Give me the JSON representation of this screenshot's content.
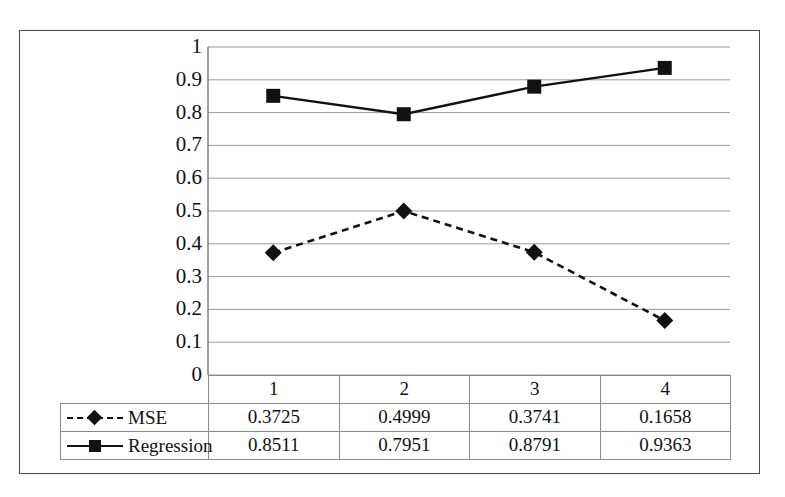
{
  "chart_data": {
    "type": "line",
    "title": "",
    "xlabel": "",
    "ylabel": "",
    "categories": [
      "1",
      "2",
      "3",
      "4"
    ],
    "ylim": [
      0,
      1
    ],
    "ytick_labels": [
      "1",
      "0.9",
      "0.8",
      "0.7",
      "0.6",
      "0.5",
      "0.4",
      "0.3",
      "0.2",
      "0.1",
      "0"
    ],
    "ytick_values": [
      1,
      0.9,
      0.8,
      0.7,
      0.6,
      0.5,
      0.4,
      0.3,
      0.2,
      0.1,
      0
    ],
    "grid": true,
    "grid_axis": "y",
    "legend_position": "table-below",
    "series": [
      {
        "name": "MSE",
        "values": [
          0.3725,
          0.4999,
          0.3741,
          0.1658
        ],
        "labels": [
          "0.3725",
          "0.4999",
          "0.3741",
          "0.1658"
        ],
        "line_style": "dashed",
        "marker": "diamond",
        "color": "#111111"
      },
      {
        "name": "Regression",
        "values": [
          0.8511,
          0.7951,
          0.8791,
          0.9363
        ],
        "labels": [
          "0.8511",
          "0.7951",
          "0.8791",
          "0.9363"
        ],
        "line_style": "solid",
        "marker": "square",
        "color": "#111111"
      }
    ]
  },
  "data_table": {
    "corner_label": "",
    "category_header": [
      "1",
      "2",
      "3",
      "4"
    ],
    "rows": [
      {
        "name": "MSE",
        "marker": "diamond",
        "line_style": "dashed",
        "cells": [
          "0.3725",
          "0.4999",
          "0.3741",
          "0.1658"
        ]
      },
      {
        "name": "Regression",
        "marker": "square",
        "line_style": "solid",
        "cells": [
          "0.8511",
          "0.7951",
          "0.8791",
          "0.9363"
        ]
      }
    ]
  },
  "caption_sliver": {
    "text": ""
  },
  "colors": {
    "frame": "#4a4a4a",
    "gridline": "#9a9a9a",
    "series": "#111111",
    "table_border": "#8a8a8a"
  }
}
